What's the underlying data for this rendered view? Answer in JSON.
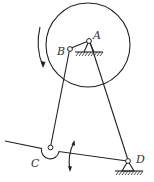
{
  "diagram": {
    "type": "planar-mechanism",
    "labels": {
      "A": "A",
      "B": "B",
      "C": "C",
      "D": "D"
    },
    "components": {
      "disk": {
        "center": [
          88,
          45
        ],
        "radius": 42
      },
      "crank_AB": {
        "from": "A",
        "to": "B"
      },
      "link_BC": {
        "from": "B",
        "to": "C"
      },
      "link_AD": {
        "from": "A",
        "to": "D"
      },
      "lever_CD": {
        "from": "C",
        "to": "D",
        "extends_left": true
      },
      "ground_A": true,
      "ground_D": true,
      "rotation_arrow": "counterclockwise-on-left-side",
      "oscillation_arrow": "vertical-double-headed-at-lever"
    },
    "colors": {
      "stroke": "#222222",
      "background": "#ffffff",
      "text": "#333333"
    }
  }
}
